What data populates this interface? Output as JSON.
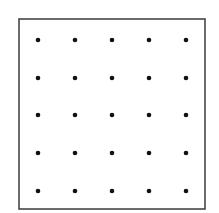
{
  "diagram": {
    "type": "dot-grid",
    "rows": 5,
    "cols": 5,
    "frame": {
      "x": 19,
      "y": 19,
      "width": 186,
      "height": 190,
      "stroke": "#3a3a3a",
      "stroke_width": 1.5
    },
    "dot": {
      "radius": 2.3,
      "color": "#111111"
    },
    "col_x": [
      38,
      75,
      112,
      149,
      186
    ],
    "row_y": [
      40,
      78,
      115,
      153,
      191
    ]
  }
}
